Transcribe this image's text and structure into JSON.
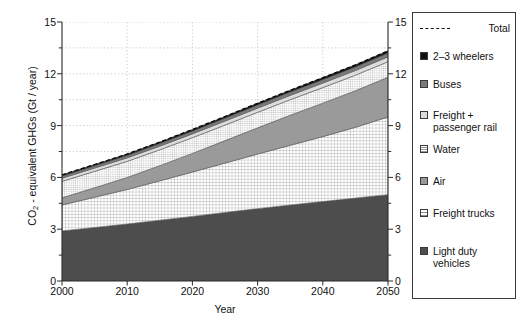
{
  "chart_data": {
    "type": "area",
    "title": "",
    "xlabel": "Year",
    "ylabel": "CO2 - equivalent GHGs (Gt / year)",
    "ylabel_prefix": "CO",
    "ylabel_sub": "2",
    "ylabel_suffix": " - equivalent GHGs (Gt / year)",
    "x": [
      2000,
      2005,
      2010,
      2015,
      2020,
      2025,
      2030,
      2035,
      2040,
      2045,
      2050
    ],
    "xlim": [
      2000,
      2050
    ],
    "ylim": [
      0,
      15
    ],
    "xticks": [
      "2000",
      "2010",
      "2020",
      "2030",
      "2040",
      "2050"
    ],
    "xtick_values": [
      2000,
      2010,
      2020,
      2030,
      2040,
      2050
    ],
    "yticks": [
      "0",
      "3",
      "6",
      "9",
      "12",
      "15"
    ],
    "ytick_values": [
      0,
      3,
      6,
      9,
      12,
      15
    ],
    "yticks_right": [
      "0",
      "3",
      "6",
      "9",
      "12",
      "15"
    ],
    "yminor_step": 1.5,
    "grid": true,
    "grid_style": "dotted",
    "stacked": true,
    "legend_position": "right",
    "series": [
      {
        "name": "Light duty vehicles",
        "fill": "#4d4d4d",
        "pattern": "solid",
        "values": [
          2.9,
          3.1,
          3.3,
          3.52,
          3.74,
          3.97,
          4.19,
          4.4,
          4.6,
          4.8,
          5.0
        ]
      },
      {
        "name": "Freight trucks",
        "fill": "#e8e8e8",
        "pattern": "grid",
        "values": [
          1.5,
          1.75,
          2.0,
          2.28,
          2.57,
          2.86,
          3.16,
          3.46,
          3.76,
          4.1,
          4.5
        ]
      },
      {
        "name": "Air",
        "fill": "#9a9a9a",
        "pattern": "solid",
        "values": [
          0.42,
          0.55,
          0.7,
          0.88,
          1.08,
          1.3,
          1.52,
          1.74,
          1.94,
          2.12,
          2.3
        ]
      },
      {
        "name": "Water",
        "fill": "#f2f2f2",
        "pattern": "fine-grid",
        "values": [
          0.95,
          0.95,
          0.93,
          0.92,
          0.91,
          0.9,
          0.9,
          0.9,
          0.9,
          0.9,
          0.9
        ]
      },
      {
        "name": "Freight + passenger rail",
        "fill": "#dcdcdc",
        "pattern": "solid",
        "values": [
          0.18,
          0.19,
          0.2,
          0.21,
          0.22,
          0.23,
          0.24,
          0.25,
          0.26,
          0.27,
          0.28
        ]
      },
      {
        "name": "Buses",
        "fill": "#7a7a7a",
        "pattern": "solid",
        "values": [
          0.12,
          0.13,
          0.14,
          0.15,
          0.16,
          0.17,
          0.18,
          0.19,
          0.2,
          0.21,
          0.22
        ]
      },
      {
        "name": "2-3 wheelers",
        "fill": "#111111",
        "pattern": "solid",
        "values": [
          0.08,
          0.08,
          0.09,
          0.09,
          0.1,
          0.1,
          0.11,
          0.11,
          0.12,
          0.12,
          0.13
        ]
      }
    ],
    "total": {
      "name": "Total",
      "style": "dashed",
      "values": [
        6.15,
        6.75,
        7.36,
        8.05,
        8.78,
        9.53,
        10.3,
        11.05,
        11.78,
        12.52,
        13.33
      ]
    }
  },
  "legend": {
    "entries": [
      {
        "label": "Total",
        "swatch": "dashed-line"
      },
      {
        "label": "2–3 wheelers",
        "swatch": "solid",
        "color": "#111111"
      },
      {
        "label": "Buses",
        "swatch": "solid",
        "color": "#7a7a7a"
      },
      {
        "label": "Freight +\npassenger rail",
        "swatch": "solid",
        "color": "#dcdcdc"
      },
      {
        "label": "Water",
        "swatch": "fine-grid",
        "color": "#f2f2f2"
      },
      {
        "label": "Air",
        "swatch": "solid",
        "color": "#9a9a9a"
      },
      {
        "label": "Freight trucks",
        "swatch": "grid",
        "color": "#e8e8e8"
      },
      {
        "label": "Light duty\nvehicles",
        "swatch": "solid",
        "color": "#4d4d4d"
      }
    ]
  }
}
